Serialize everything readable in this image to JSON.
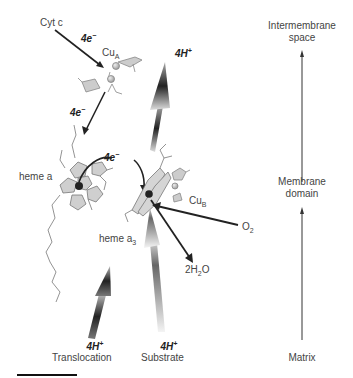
{
  "diagram": {
    "labels": {
      "cyt_c": "Cyt c",
      "cu_a": "Cu",
      "cu_a_sub": "A",
      "cu_b": "Cu",
      "cu_b_sub": "B",
      "heme_a": "heme a",
      "heme_a3": "heme a",
      "heme_a3_sub": "3",
      "o2": "O",
      "o2_sub": "2",
      "water_prefix": "2H",
      "water_sub": "2",
      "water_suffix": "O",
      "e1": "4e",
      "e2": "4e",
      "e3": "4e",
      "e_sup": "−",
      "h_top": "4H",
      "h_trans": "4H",
      "h_sub": "4H",
      "h_sup": "+",
      "translocation": "Translocation",
      "substrate": "Substrate"
    },
    "axis": {
      "top": [
        "Intermembrane",
        "space"
      ],
      "middle": [
        "Membrane",
        "domain"
      ],
      "bottom": "Matrix"
    }
  }
}
